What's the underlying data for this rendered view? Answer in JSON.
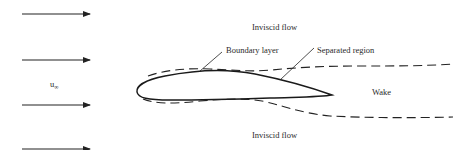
{
  "figure": {
    "labels": {
      "inviscid_top": "Inviscid flow",
      "inviscid_bottom": "Inviscid flow",
      "boundary_layer": "Boundary layer",
      "separated_region": "Separated region",
      "wake": "Wake",
      "freestream_symbol": "u",
      "freestream_subscript": "∞"
    },
    "freestream_arrows": 4,
    "colors": {
      "ink": "#222222",
      "background": "#ffffff"
    }
  }
}
